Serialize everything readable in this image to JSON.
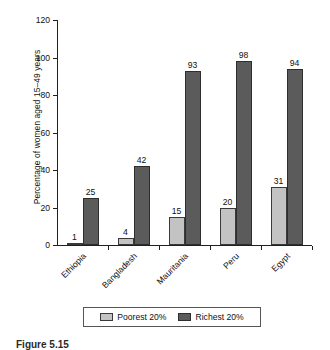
{
  "chart_data": {
    "type": "bar",
    "title": "",
    "xlabel": "",
    "ylabel": "Percentage of women aged 15–49 years",
    "ylim": [
      0,
      120
    ],
    "yticks": [
      0,
      20,
      40,
      60,
      80,
      100,
      120
    ],
    "grid": false,
    "legend_position": "bottom",
    "categories": [
      "Ethiopia",
      "Bangladesh",
      "Mauritania",
      "Peru",
      "Egypt"
    ],
    "series": [
      {
        "name": "Poorest 20%",
        "color": "#c3c3c3",
        "values": [
          1,
          4,
          15,
          20,
          31
        ]
      },
      {
        "name": "Richest 20%",
        "color": "#5b5b5b",
        "values": [
          25,
          42,
          93,
          98,
          94
        ]
      }
    ]
  },
  "caption": {
    "label": "Figure 5.15",
    "text": ""
  }
}
